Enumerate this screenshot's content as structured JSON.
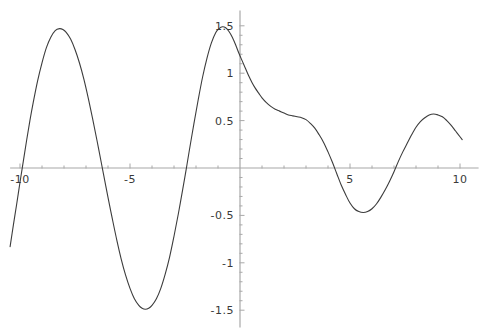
{
  "chart_data": {
    "type": "line",
    "title": "",
    "subtitle": "",
    "xlabel": "",
    "ylabel": "",
    "xlim": [
      -10.45,
      10.3
    ],
    "ylim": [
      -1.62,
      1.62
    ],
    "grid": false,
    "legend": null,
    "axis_color": "#a8a8a8",
    "curve_color": "#3c3c3c",
    "x_ticks_major": [
      -10,
      -5,
      5,
      10
    ],
    "x_tick_labels": [
      "-10",
      "-5",
      "5",
      "10"
    ],
    "x_ticks_minor": [
      -9,
      -8,
      -7,
      -6,
      -4,
      -3,
      -2,
      -1,
      1,
      2,
      3,
      4,
      6,
      7,
      8,
      9
    ],
    "y_ticks_major": [
      1.5,
      1,
      0.5,
      -0.5,
      -1,
      -1.5
    ],
    "y_tick_labels": [
      "1.5",
      "1",
      "0.5",
      "-0.5",
      "-1",
      "-1.5"
    ],
    "y_ticks_minor": [
      1.4,
      1.3,
      1.2,
      1.1,
      0.9,
      0.8,
      0.7,
      0.6,
      0.4,
      0.3,
      0.2,
      0.1,
      -0.1,
      -0.2,
      -0.3,
      -0.4,
      -0.6,
      -0.7,
      -0.8,
      -0.9,
      -1.1,
      -1.2,
      -1.3,
      -1.4
    ],
    "series": [
      {
        "name": "curve",
        "points": [
          [
            -10.45,
            -0.83
          ],
          [
            -10.3,
            -0.6
          ],
          [
            -10.15,
            -0.38
          ],
          [
            -10.0,
            -0.15
          ],
          [
            -9.85,
            0.07
          ],
          [
            -9.7,
            0.29
          ],
          [
            -9.55,
            0.5
          ],
          [
            -9.4,
            0.69
          ],
          [
            -9.2,
            0.92
          ],
          [
            -9.0,
            1.11
          ],
          [
            -8.8,
            1.27
          ],
          [
            -8.6,
            1.38
          ],
          [
            -8.4,
            1.45
          ],
          [
            -8.2,
            1.47
          ],
          [
            -8.05,
            1.46
          ],
          [
            -7.9,
            1.43
          ],
          [
            -7.7,
            1.36
          ],
          [
            -7.5,
            1.25
          ],
          [
            -7.3,
            1.11
          ],
          [
            -7.1,
            0.94
          ],
          [
            -6.9,
            0.74
          ],
          [
            -6.7,
            0.52
          ],
          [
            -6.5,
            0.29
          ],
          [
            -6.3,
            0.05
          ],
          [
            -6.15,
            -0.13
          ],
          [
            -6.0,
            -0.31
          ],
          [
            -5.8,
            -0.54
          ],
          [
            -5.6,
            -0.76
          ],
          [
            -5.4,
            -0.96
          ],
          [
            -5.2,
            -1.13
          ],
          [
            -5.0,
            -1.27
          ],
          [
            -4.8,
            -1.38
          ],
          [
            -4.6,
            -1.45
          ],
          [
            -4.45,
            -1.48
          ],
          [
            -4.3,
            -1.49
          ],
          [
            -4.15,
            -1.48
          ],
          [
            -4.0,
            -1.45
          ],
          [
            -3.8,
            -1.38
          ],
          [
            -3.6,
            -1.27
          ],
          [
            -3.4,
            -1.12
          ],
          [
            -3.2,
            -0.94
          ],
          [
            -3.0,
            -0.72
          ],
          [
            -2.8,
            -0.48
          ],
          [
            -2.6,
            -0.22
          ],
          [
            -2.45,
            -0.02
          ],
          [
            -2.3,
            0.19
          ],
          [
            -2.1,
            0.46
          ],
          [
            -1.9,
            0.72
          ],
          [
            -1.7,
            0.96
          ],
          [
            -1.5,
            1.16
          ],
          [
            -1.3,
            1.32
          ],
          [
            -1.1,
            1.43
          ],
          [
            -0.95,
            1.47
          ],
          [
            -0.8,
            1.49
          ],
          [
            -0.65,
            1.48
          ],
          [
            -0.5,
            1.44
          ],
          [
            -0.35,
            1.38
          ],
          [
            -0.2,
            1.3
          ],
          [
            -0.05,
            1.21
          ],
          [
            0.1,
            1.13
          ],
          [
            0.25,
            1.05
          ],
          [
            0.4,
            0.97
          ],
          [
            0.55,
            0.9
          ],
          [
            0.7,
            0.84
          ],
          [
            0.85,
            0.79
          ],
          [
            1.0,
            0.74
          ],
          [
            1.2,
            0.69
          ],
          [
            1.4,
            0.65
          ],
          [
            1.6,
            0.62
          ],
          [
            1.8,
            0.6
          ],
          [
            2.0,
            0.58
          ],
          [
            2.2,
            0.56
          ],
          [
            2.4,
            0.55
          ],
          [
            2.6,
            0.54
          ],
          [
            2.8,
            0.53
          ],
          [
            3.0,
            0.51
          ],
          [
            3.2,
            0.47
          ],
          [
            3.4,
            0.42
          ],
          [
            3.6,
            0.35
          ],
          [
            3.8,
            0.27
          ],
          [
            4.0,
            0.17
          ],
          [
            4.2,
            0.06
          ],
          [
            4.4,
            -0.06
          ],
          [
            4.6,
            -0.18
          ],
          [
            4.8,
            -0.28
          ],
          [
            5.0,
            -0.37
          ],
          [
            5.2,
            -0.43
          ],
          [
            5.4,
            -0.46
          ],
          [
            5.6,
            -0.47
          ],
          [
            5.8,
            -0.46
          ],
          [
            6.0,
            -0.43
          ],
          [
            6.2,
            -0.38
          ],
          [
            6.4,
            -0.31
          ],
          [
            6.6,
            -0.23
          ],
          [
            6.8,
            -0.14
          ],
          [
            7.0,
            -0.04
          ],
          [
            7.2,
            0.07
          ],
          [
            7.4,
            0.17
          ],
          [
            7.6,
            0.26
          ],
          [
            7.8,
            0.35
          ],
          [
            8.0,
            0.43
          ],
          [
            8.2,
            0.49
          ],
          [
            8.4,
            0.53
          ],
          [
            8.6,
            0.56
          ],
          [
            8.8,
            0.57
          ],
          [
            9.0,
            0.56
          ],
          [
            9.2,
            0.54
          ],
          [
            9.4,
            0.5
          ],
          [
            9.6,
            0.45
          ],
          [
            9.8,
            0.39
          ],
          [
            10.0,
            0.33
          ],
          [
            10.1,
            0.3
          ]
        ]
      }
    ]
  }
}
